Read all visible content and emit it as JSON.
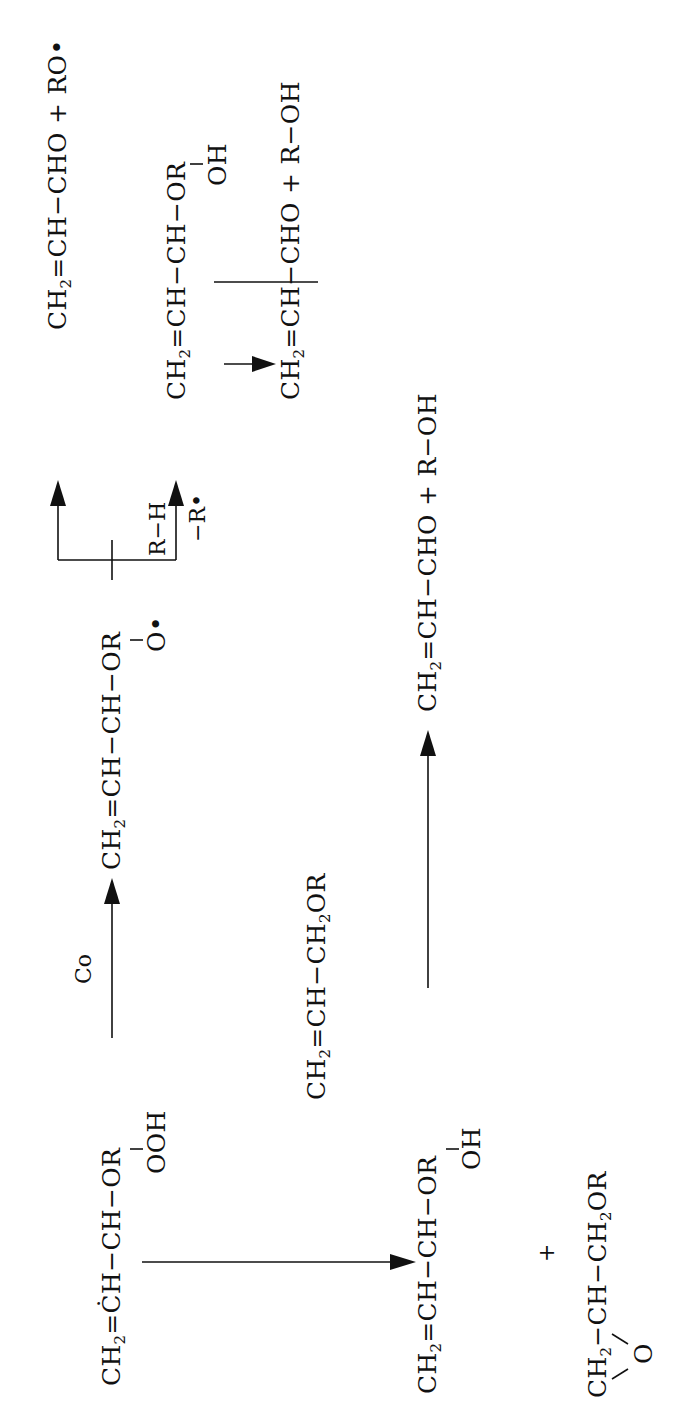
{
  "diagram": {
    "type": "reaction-scheme",
    "orientation": "rotated-90-ccw",
    "colors": {
      "ink": "#111111",
      "background": "#ffffff"
    },
    "reactant": {
      "formula_a": "CH",
      "formula_a_sub": "2",
      "formula_b": "=ĊH−CH−OR",
      "substituent": "OOH"
    },
    "step1": {
      "catalyst_label": "Co"
    },
    "alkoxy_intermediate": {
      "formula_a": "CH",
      "formula_a_sub": "2",
      "formula_b": "=CH−CH−OR",
      "substituent": "O•"
    },
    "branch": {
      "upper_product": {
        "formula_a": "CH",
        "formula_a_sub": "2",
        "formula_b": "=CH−CHO + RO•"
      },
      "reagent_label": "R−H",
      "loss_label": "−R•",
      "hydroxy_product": {
        "formula_a": "CH",
        "formula_a_sub": "2",
        "formula_b": "=CH−CH−OR",
        "substituent": "OH"
      },
      "final_product": {
        "formula_a": "CH",
        "formula_a_sub": "2",
        "formula_b": "=CH−CHO + R−OH"
      }
    },
    "lower_pathway": {
      "coreactant": {
        "formula_a": "CH",
        "formula_a_sub": "2",
        "formula_b": "=CH−CH",
        "formula_b_sub": "2",
        "formula_c": "OR"
      },
      "hydroxy_product": {
        "formula_a": "CH",
        "formula_a_sub": "2",
        "formula_b": "=CH−CH−OR",
        "substituent": "OH"
      },
      "plus": "+",
      "epoxide": {
        "formula_a": "CH",
        "formula_a_sub": "2",
        "formula_b": "−CH−CH",
        "formula_b_sub": "2",
        "formula_c": "OR",
        "ring_oxygen": "O"
      },
      "final_product": {
        "formula_a": "CH",
        "formula_a_sub": "2",
        "formula_b": "=CH−CHO + R−OH"
      }
    }
  }
}
